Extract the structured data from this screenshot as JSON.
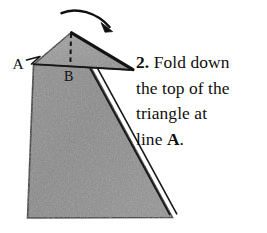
{
  "figure": {
    "step_number": "2.",
    "labels": {
      "fold_line": "A",
      "center_line": "B"
    },
    "icons": {
      "fold_arrow": "curved-arrow-icon",
      "leader": "leader-line-icon",
      "crease": "dashed-crease-icon"
    },
    "colors": {
      "paper_body": "#8b8b8b",
      "paper_flap": "#9a9a9a",
      "outline": "#141414",
      "background": "#ffffff",
      "text": "#100f0d"
    }
  },
  "instruction": {
    "step": "2.",
    "line1": "Fold down",
    "line2": "the top of the",
    "line3": "triangle at",
    "line4_prefix": "line ",
    "line4_ref": "A",
    "line4_suffix": "."
  }
}
